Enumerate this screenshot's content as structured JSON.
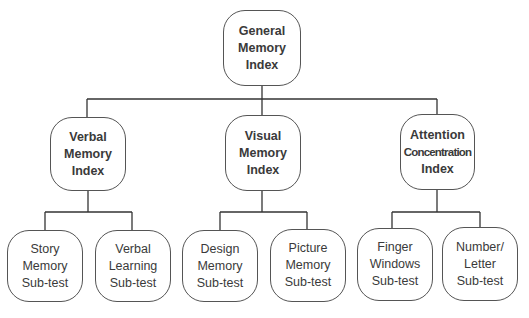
{
  "diagram": {
    "type": "hierarchy-tree",
    "root": {
      "lines": [
        "General",
        "Memory",
        "Index"
      ]
    },
    "indices": [
      {
        "lines": [
          "Verbal",
          "Memory",
          "Index"
        ],
        "subtests": [
          {
            "lines": [
              "Story",
              "Memory",
              "Sub-test"
            ]
          },
          {
            "lines": [
              "Verbal",
              "Learning",
              "Sub-test"
            ]
          }
        ]
      },
      {
        "lines": [
          "Visual",
          "Memory",
          "Index"
        ],
        "subtests": [
          {
            "lines": [
              "Design",
              "Memory",
              "Sub-test"
            ]
          },
          {
            "lines": [
              "Picture",
              "Memory",
              "Sub-test"
            ]
          }
        ]
      },
      {
        "lines": [
          "Attention",
          "Concentration",
          "Index"
        ],
        "subtests": [
          {
            "lines": [
              "Finger",
              "Windows",
              "Sub-test"
            ]
          },
          {
            "lines": [
              "Number/",
              "Letter",
              "Sub-test"
            ]
          }
        ]
      }
    ],
    "colors": {
      "line": "#333333",
      "border": "#555555",
      "text": "#3a3a3a",
      "background": "#ffffff"
    }
  }
}
